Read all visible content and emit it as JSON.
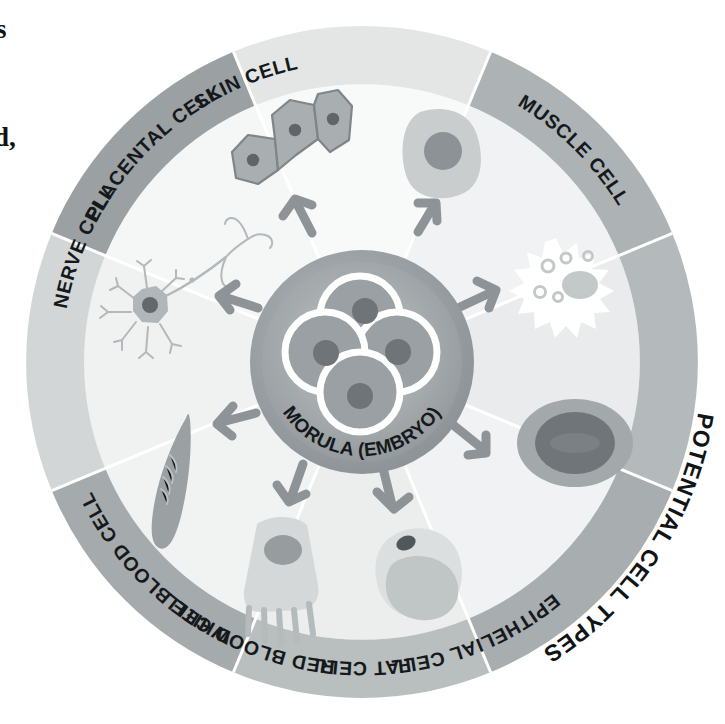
{
  "figure": {
    "title": "POTENTIAL CELL TYPES",
    "hub_label": "MORULA (EMBRYO)",
    "center_icon": "morula-embryo-icon",
    "outer_ring_label_name": "potential-cell-types-label"
  },
  "page_text_fragments": [
    {
      "name": "cropped-body-text-fragment-top",
      "text": "s"
    },
    {
      "name": "cropped-body-text-fragment-bottom",
      "text": "d,"
    }
  ],
  "colors": {
    "page_background": "#ffffff",
    "wheel_inner_light": "#f3f4f4",
    "wheel_inner_light_alt": "#eceded",
    "hub_outer": "#9aa0a3",
    "hub_inner": "#8d9396",
    "hub_highlight": "#b9bec0",
    "cell_outline_white": "#ffffff",
    "nucleus_dark": "#6e7477",
    "arrow_gray": "#8d9396",
    "divider_white": "#ffffff",
    "label_text": "#15191c",
    "band_placental": "#e4e6e6",
    "band_skin": "#adb2b4",
    "band_white_blood": "#b4b9bb",
    "band_red_blood": "#a8adaf",
    "band_fat": "#b9bebf",
    "band_epithelial": "#a5aaac",
    "band_muscle": "#d3d6d7",
    "band_nerve": "#9ba0a3"
  },
  "wheel": {
    "center_x": 362,
    "center_y": 362,
    "hub_radius": 112,
    "inner_field_radius": 278,
    "band_inner_radius": 278,
    "band_outer_radius": 336,
    "segment_count": 8
  },
  "segments": [
    {
      "id": "placental-cell",
      "label": "PLACENTAL CELL",
      "band_color": "#e4e6e6",
      "field_color": "#f7f8f8",
      "start_angle": -112.5,
      "end_angle": -67.5,
      "label_angle": -90,
      "icon": "placental-cell-icon",
      "icon_description": "cluster of three flattened polygonal cells, each with a dark nucleus",
      "arrow_angle": -90
    },
    {
      "id": "skin-cell",
      "label": "SKIN CELL",
      "band_color": "#adb2b4",
      "field_color": "#f1f2f2",
      "start_angle": -67.5,
      "end_angle": -22.5,
      "label_angle": -45,
      "icon": "skin-cell-icon",
      "icon_description": "rounded light gray cell with large dark round nucleus",
      "arrow_angle": -45
    },
    {
      "id": "white-blood-cell",
      "label": "WHITE BLOOD CELL",
      "band_color": "#b4b9bb",
      "field_color": "#eaebec",
      "start_angle": -22.5,
      "end_angle": 22.5,
      "label_angle": 0,
      "icon": "white-blood-cell-icon",
      "icon_description": "white spiky star-shaped leukocyte with gray lobed nucleus and small vacuoles",
      "arrow_angle": 0
    },
    {
      "id": "red-blood-cell",
      "label": "RED BLOOD CELL",
      "band_color": "#a8adaf",
      "field_color": "#f1f2f2",
      "start_angle": 22.5,
      "end_angle": 67.5,
      "label_angle": 45,
      "icon": "red-blood-cell-icon",
      "icon_description": "gray biconcave disc erythrocyte with darker center",
      "arrow_angle": 45
    },
    {
      "id": "fat-cell",
      "label": "FAT CELL",
      "band_color": "#b9bebf",
      "field_color": "#eceded",
      "start_angle": 67.5,
      "end_angle": 112.5,
      "label_angle": 90,
      "icon": "fat-cell-icon",
      "icon_description": "rounded adipocyte with a large lipid droplet and small dark nucleus",
      "arrow_angle": 90
    },
    {
      "id": "epithelial-cell",
      "label": "EPITHELIAL CELL",
      "band_color": "#a5aaac",
      "field_color": "#f1f2f2",
      "start_angle": 112.5,
      "end_angle": 157.5,
      "label_angle": 135,
      "icon": "epithelial-cell-icon",
      "icon_description": "columnar cell with round nucleus and microvilli/cilia along the lower edge",
      "arrow_angle": 135
    },
    {
      "id": "muscle-cell",
      "label": "MUSCLE CELL",
      "band_color": "#d3d6d7",
      "field_color": "#f0f1f1",
      "start_angle": 157.5,
      "end_angle": 202.5,
      "label_angle": 180,
      "icon": "muscle-cell-icon",
      "icon_description": "long tapered spindle-shaped smooth muscle fiber with striations",
      "arrow_angle": 180
    },
    {
      "id": "nerve-cell",
      "label": "NERVE CELL",
      "band_color": "#9ba0a3",
      "field_color": "#f5f6f6",
      "start_angle": 202.5,
      "end_angle": 247.5,
      "label_angle": 225,
      "icon": "nerve-cell-icon",
      "icon_description": "neuron with star-shaped soma, dendrites and a long branching axon",
      "arrow_angle": 225
    }
  ],
  "morula": {
    "blastomere_count": 4,
    "description": "four rounded blastomeres outlined in white, each with a dark nucleus"
  }
}
